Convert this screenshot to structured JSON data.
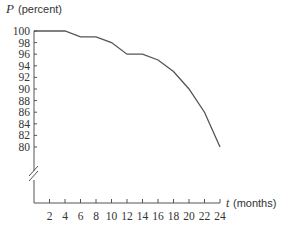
{
  "chart_data": {
    "type": "line",
    "title": "",
    "ylabel_var": "P",
    "ylabel_unit": "(percent)",
    "xlabel_var": "t",
    "xlabel_unit": "(months)",
    "x": [
      0,
      4,
      6,
      8,
      10,
      12,
      14,
      16,
      18,
      20,
      22,
      24
    ],
    "series": [
      {
        "name": "P",
        "values": [
          100,
          100,
          99,
          99,
          98,
          96,
          96,
          95,
          93,
          90,
          86,
          80
        ]
      }
    ],
    "xticks": [
      "2",
      "4",
      "6",
      "8",
      "10",
      "12",
      "14",
      "16",
      "18",
      "20",
      "22",
      "24"
    ],
    "yticks": [
      "100",
      "98",
      "96",
      "94",
      "92",
      "90",
      "88",
      "86",
      "84",
      "82",
      "80"
    ],
    "xlim": [
      0,
      24
    ],
    "ylim": [
      80,
      100
    ],
    "axis_break_on_y": true,
    "grid": false,
    "legend": null,
    "line_color": "#555555"
  }
}
